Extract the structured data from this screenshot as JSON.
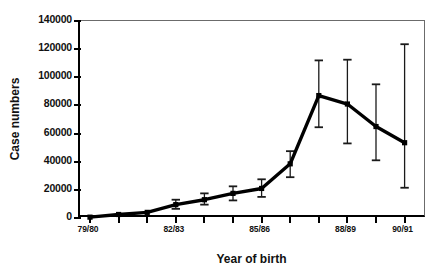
{
  "chart_data": {
    "type": "line",
    "title": "",
    "xlabel": "Year of birth",
    "ylabel": "Case numbers",
    "ylim": [
      0,
      140000
    ],
    "ytick_values": [
      0,
      20000,
      40000,
      60000,
      80000,
      100000,
      120000,
      140000
    ],
    "ytick_labels": [
      "0",
      "20000",
      "40000",
      "60000",
      "80000",
      "100000",
      "120000",
      "140000"
    ],
    "grid": false,
    "legend": null,
    "error_bars": "vertical, capped",
    "x_axis_note": "one tick per birth-year cohort; labelled every third tick",
    "categories": [
      "79/80",
      "80/81",
      "81/82",
      "82/83",
      "83/84",
      "84/85",
      "85/86",
      "86/87",
      "87/88",
      "88/89",
      "89/90",
      "90/91"
    ],
    "xtick_labels": [
      "79/80",
      "",
      "",
      "82/83",
      "",
      "",
      "85/86",
      "",
      "",
      "88/89",
      "",
      "90/91"
    ],
    "series": [
      {
        "name": "Case numbers",
        "values": [
          600,
          2500,
          4000,
          9500,
          13000,
          17500,
          21000,
          38500,
          87000,
          81000,
          65000,
          53500
        ],
        "err_low": [
          600,
          2500,
          4000,
          6500,
          9500,
          12500,
          15000,
          29000,
          64500,
          53000,
          41000,
          21500
        ],
        "err_high": [
          600,
          2500,
          4000,
          13000,
          17500,
          22500,
          27500,
          47500,
          112000,
          112500,
          95000,
          123500
        ]
      }
    ]
  }
}
